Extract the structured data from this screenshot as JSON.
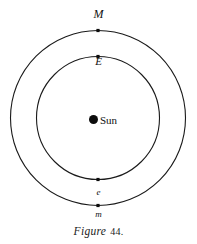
{
  "figure": {
    "caption_word": "Figure",
    "caption_number": "44.",
    "background_color": "#ffffff",
    "ink_color": "#111111"
  },
  "labels": {
    "outer_orbit_top": "M",
    "inner_orbit_top": "E",
    "inner_orbit_bottom": "e",
    "outer_orbit_bottom": "m",
    "center_body": "Sun"
  },
  "chart_data": {
    "type": "scatter",
    "subtitle": "",
    "xlabel": "",
    "ylabel": "",
    "grid": false,
    "legend_position": "none",
    "center": {
      "label": "Sun",
      "x": 98,
      "y": 118,
      "marker": "filled-circle",
      "marker_size": 9
    },
    "orbits": [
      {
        "name": "outer-orbit",
        "body_label_upper": "M",
        "body_label_lower": "m",
        "radius": 87.5,
        "center_x": 98,
        "center_y": 118,
        "stroke": "#1a1a1a",
        "stroke_width": 1.1
      },
      {
        "name": "inner-orbit",
        "body_label_upper": "E",
        "body_label_lower": "e",
        "radius": 61.5,
        "center_x": 98,
        "center_y": 118,
        "stroke": "#1a1a1a",
        "stroke_width": 1.1
      }
    ],
    "points": [
      {
        "label": "M",
        "orbit": "outer-orbit",
        "x": 98,
        "y": 30.5,
        "angle_deg": 90,
        "marker": "small-filled-square"
      },
      {
        "label": "E",
        "orbit": "inner-orbit",
        "x": 98,
        "y": 56.5,
        "angle_deg": 90,
        "marker": "small-filled-square"
      },
      {
        "label": "e",
        "orbit": "inner-orbit",
        "x": 98,
        "y": 179.5,
        "angle_deg": 270,
        "marker": "small-filled-square"
      },
      {
        "label": "m",
        "orbit": "outer-orbit",
        "x": 98,
        "y": 205.5,
        "angle_deg": 270,
        "marker": "small-filled-square"
      }
    ],
    "xlim": [
      0,
      197
    ],
    "ylim": [
      0,
      244
    ]
  }
}
